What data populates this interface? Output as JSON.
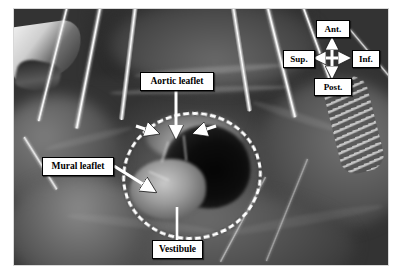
{
  "figure": {
    "kind": "intraoperative-photograph",
    "background_color": "#ffffff",
    "photo_tone": "grayscale"
  },
  "annotations": {
    "aortic_leaflet": {
      "label": "Aortic leaflet",
      "box": {
        "left": 140,
        "top": 72,
        "width": 72,
        "height": 17
      },
      "pointer": "down-arrow"
    },
    "mural_leaflet": {
      "label": "Mural leaflet",
      "box": {
        "left": 42,
        "top": 157,
        "width": 70,
        "height": 17
      },
      "pointer": "diagonal-down-right-arrow"
    },
    "vestibule": {
      "label": "Vestibule",
      "box": {
        "left": 152,
        "top": 240,
        "width": 49,
        "height": 17
      },
      "pointer": "up-leader-line"
    }
  },
  "outline": {
    "name": "vestibule-dashed-ellipse",
    "style": "white dashed ellipse",
    "color": "#ffffff"
  },
  "compass": {
    "name": "orientation-compass",
    "anterior": "Ant.",
    "posterior": "Post.",
    "superior": "Sup.",
    "inferior": "Inf.",
    "arrow_color": "#ffffff",
    "boxes": {
      "anterior": {
        "left": 316,
        "top": 20,
        "width": 32,
        "height": 16
      },
      "superior": {
        "left": 283,
        "top": 50,
        "width": 30,
        "height": 16
      },
      "inferior": {
        "left": 352,
        "top": 50,
        "width": 26,
        "height": 16
      },
      "posterior": {
        "left": 314,
        "top": 78,
        "width": 36,
        "height": 16
      }
    }
  },
  "instruments": [
    {
      "name": "retractor-suture-strand"
    },
    {
      "name": "retractor-suture-strand"
    },
    {
      "name": "retractor-suture-strand"
    },
    {
      "name": "retractor-suture-strand"
    },
    {
      "name": "cannula-tube"
    },
    {
      "name": "cannula-tube"
    },
    {
      "name": "coiled-drain-tube"
    },
    {
      "name": "surgical-clamp"
    }
  ]
}
